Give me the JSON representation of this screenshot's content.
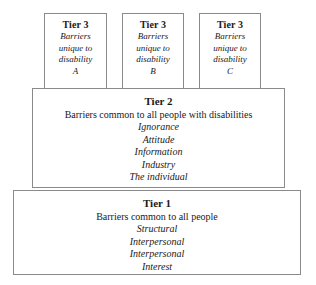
{
  "diagram": {
    "colors": {
      "background": "#ffffff",
      "border": "#8a8a8a",
      "text": "#1a1a1a"
    },
    "tier3": {
      "boxes": [
        {
          "heading": "Tier 3",
          "lines": [
            "Barriers",
            "unique to",
            "disability",
            "A"
          ]
        },
        {
          "heading": "Tier 3",
          "lines": [
            "Barriers",
            "unique to",
            "disability",
            "B"
          ]
        },
        {
          "heading": "Tier 3",
          "lines": [
            "Barriers",
            "unique to",
            "disability",
            "C"
          ]
        }
      ]
    },
    "tier2": {
      "heading": "Tier 2",
      "subheading": "Barriers common to all people with disabilities",
      "items": [
        "Ignorance",
        "Attitude",
        "Information",
        "Industry",
        "The individual"
      ]
    },
    "tier1": {
      "heading": "Tier 1",
      "subheading": "Barriers common to all people",
      "items": [
        "Structural",
        "Interpersonal",
        "Interpersonal",
        "Interest"
      ]
    }
  }
}
